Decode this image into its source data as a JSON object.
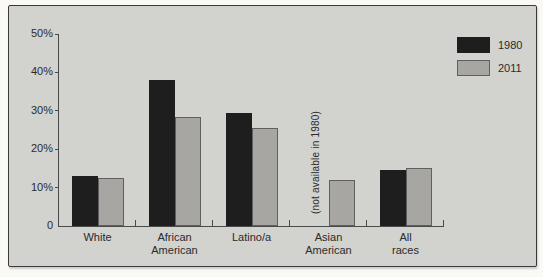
{
  "frame": {
    "page_background": "#faf9f6",
    "panel_background": "#d2d2ce",
    "panel_border": "#3a3a3a"
  },
  "colors": {
    "axis": "#4a4a4a",
    "text": "#2b2b2b",
    "bar_border": "#5f5f5f"
  },
  "chart_data": {
    "type": "bar",
    "title": "",
    "xlabel": "",
    "ylabel": "",
    "unit": "%",
    "categories": [
      "White",
      "African American",
      "Latino/a",
      "Asian American",
      "All races"
    ],
    "category_label_lines": [
      [
        "White"
      ],
      [
        "African",
        "American"
      ],
      [
        "Latino/a"
      ],
      [
        "Asian",
        "American"
      ],
      [
        "All races"
      ]
    ],
    "series": [
      {
        "name": "1980",
        "color": "#1e1e1e",
        "values": [
          13,
          38,
          29.5,
          null,
          14.5
        ]
      },
      {
        "name": "2011",
        "color": "#a7a6a2",
        "values": [
          12.5,
          28.5,
          25.5,
          12,
          15
        ]
      }
    ],
    "ylim": [
      0,
      50
    ],
    "yticks": [
      {
        "value": 50,
        "label": "50%"
      },
      {
        "value": 40,
        "label": "40%"
      },
      {
        "value": 30,
        "label": "30%"
      },
      {
        "value": 20,
        "label": "20%"
      },
      {
        "value": 10,
        "label": "10%"
      },
      {
        "value": 0,
        "label": "0"
      }
    ],
    "grid": false,
    "legend_position": "top-right",
    "annotation": {
      "text": "(not available in 1980)",
      "category": "Asian American",
      "series": "1980",
      "rotation_deg": -90
    }
  }
}
